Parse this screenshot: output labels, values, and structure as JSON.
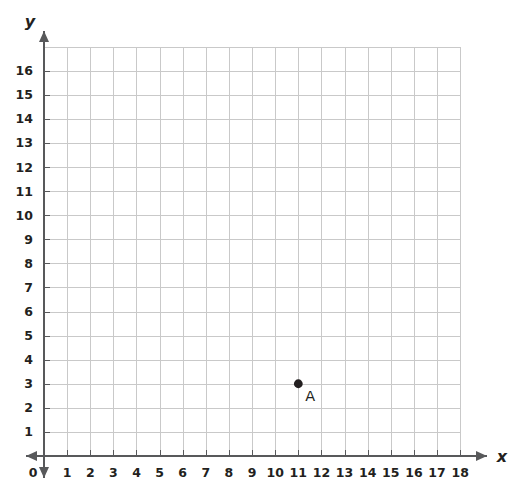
{
  "chart_data": {
    "type": "scatter",
    "title": "",
    "xlabel": "x",
    "ylabel": "y",
    "grid": true,
    "legend": false,
    "origin_label": "0",
    "xlim": [
      0,
      18
    ],
    "ylim": [
      0,
      17
    ],
    "x_tick_labels": [
      "1",
      "2",
      "3",
      "4",
      "5",
      "6",
      "7",
      "8",
      "9",
      "10",
      "11",
      "12",
      "13",
      "14",
      "15",
      "16",
      "17",
      "18"
    ],
    "y_tick_labels": [
      "1",
      "2",
      "3",
      "4",
      "5",
      "6",
      "7",
      "8",
      "9",
      "10",
      "11",
      "12",
      "13",
      "14",
      "15",
      "16"
    ],
    "x_ticks": [
      1,
      2,
      3,
      4,
      5,
      6,
      7,
      8,
      9,
      10,
      11,
      12,
      13,
      14,
      15,
      16,
      17,
      18
    ],
    "y_ticks": [
      1,
      2,
      3,
      4,
      5,
      6,
      7,
      8,
      9,
      10,
      11,
      12,
      13,
      14,
      15,
      16
    ],
    "grid_columns": 18,
    "grid_rows": 17,
    "points": [
      {
        "label": "A",
        "x": 11,
        "y": 3
      }
    ],
    "colors": {
      "grid": "#c9c9c9",
      "axis": "#58595b",
      "text": "#231f20",
      "point": "#231f20",
      "background": "#ffffff"
    }
  }
}
